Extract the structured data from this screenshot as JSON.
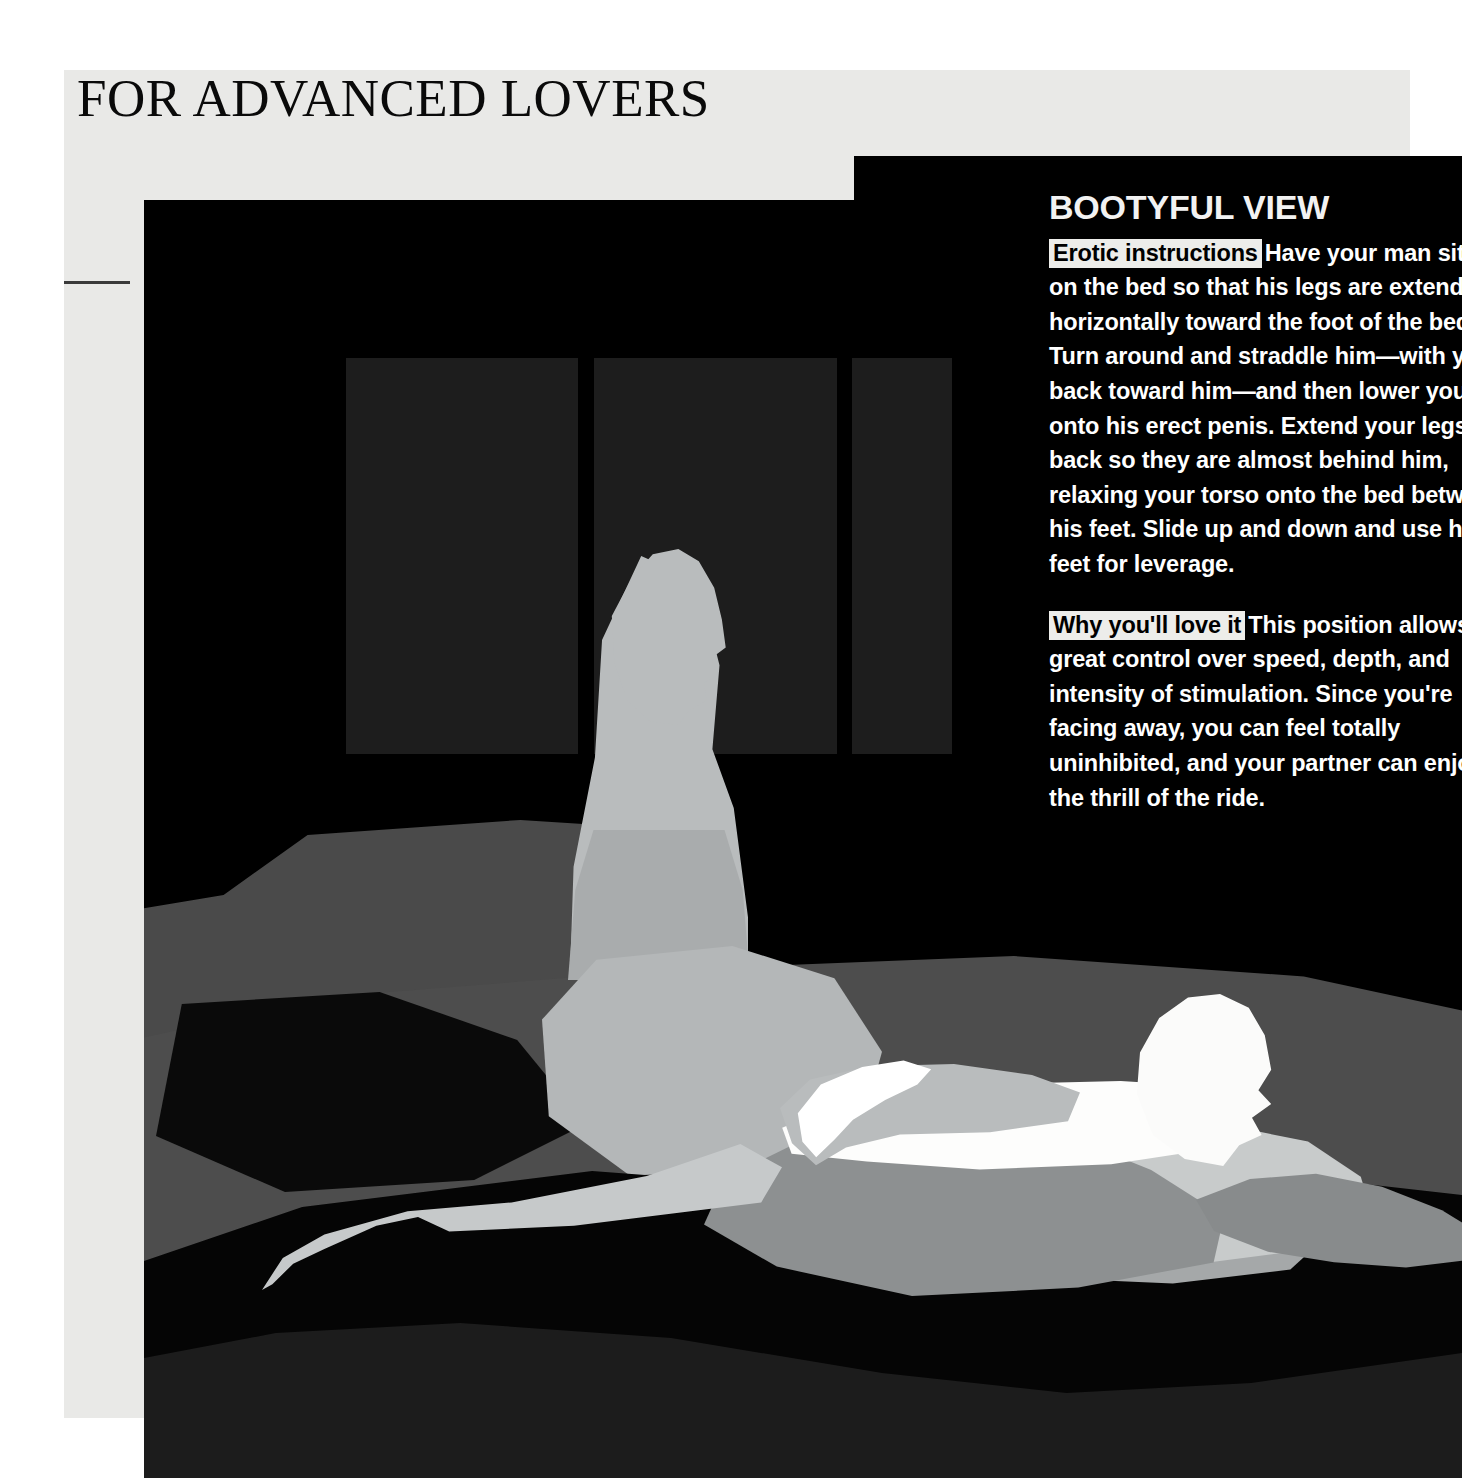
{
  "page": {
    "masthead": "FOR ADVANCED LOVERS"
  },
  "article": {
    "title": "BOOTYFUL VIEW",
    "sections": [
      {
        "kicker": "Erotic instructions",
        "body": "Have your man sit up on the bed so that his legs are extended horizontally toward the foot of the bed. Turn around and straddle him—with your back toward him—and then lower yourself onto his erect penis. Extend your legs back so they are almost behind him, relaxing your torso onto the bed between his feet. Slide up and down and use his feet for leverage."
      },
      {
        "kicker": "Why you'll love it",
        "body": "This position allows for great control over speed, depth, and intensity of stimulation. Since you're facing away, you can feel totally uninhibited, and your partner can enjoy the thrill of the ride."
      }
    ]
  },
  "illustration": {
    "description": "Silhouette illustration of a couple on a bed in a dark bedroom with three window panels behind them",
    "figures": [
      {
        "name": "man",
        "tone": "#b9bcbd"
      },
      {
        "name": "woman",
        "tone": "#fdfdfc"
      }
    ],
    "colors": {
      "plate_background": "#000000",
      "page_paper": "#e9e9e7",
      "window_panel": "#1d1d1d",
      "mattress": "#4d4d4d",
      "headboard": "#4a4a4a",
      "foreground_band": "#1c1c1c",
      "kicker_highlight": "#ededea",
      "body_text": "#ffffff",
      "masthead_text": "#0a0a0a"
    }
  }
}
